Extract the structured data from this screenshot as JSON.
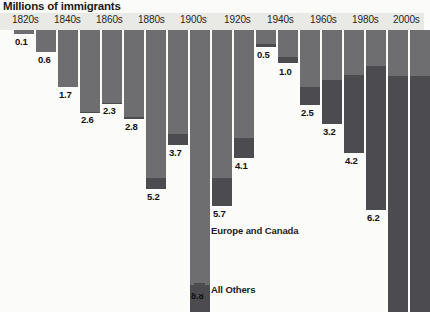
{
  "chart_data": {
    "type": "bar",
    "title": "Millions of immigrants",
    "xlabel": "",
    "ylabel": "Millions of immigrants",
    "grid": false,
    "orientation": "vertical-downward",
    "legend_position": "inside-center",
    "ylim": [
      0,
      10.5
    ],
    "categories": [
      "1820s",
      "1830s",
      "1840s",
      "1850s",
      "1860s",
      "1870s",
      "1880s",
      "1890s",
      "1900s",
      "1910s",
      "1920s",
      "1930s",
      "1940s",
      "1950s",
      "1960s",
      "1970s",
      "1980s",
      "1990s",
      "2000s"
    ],
    "tick_labels": [
      "1820s",
      "1840s",
      "1860s",
      "1880s",
      "1900s",
      "1920s",
      "1940s",
      "1960s",
      "1980s",
      "2000s"
    ],
    "values": [
      0.1,
      0.6,
      1.7,
      2.6,
      2.3,
      2.8,
      5.2,
      3.7,
      8.8,
      5.7,
      4.1,
      0.5,
      1.0,
      2.5,
      3.2,
      4.2,
      6.2,
      9.8,
      10.3
    ],
    "value_labels": [
      "0.1",
      "0.6",
      "1.7",
      "2.6",
      "2.3",
      "2.8",
      "5.2",
      "3.7",
      "8.8",
      "5.7",
      "4.1",
      "0.5",
      "1.0",
      "2.5",
      "3.2",
      "4.2",
      "6.2",
      "",
      ""
    ],
    "series": [
      {
        "name": "Europe and Canada",
        "color": "#6e6e70",
        "values": [
          0.1,
          0.6,
          1.7,
          2.6,
          2.3,
          2.8,
          4.8,
          3.3,
          8.1,
          4.8,
          3.5,
          0.4,
          0.8,
          2.0,
          1.8,
          1.6,
          1.2,
          1.6,
          1.6
        ]
      },
      {
        "name": "All Others",
        "color": "#4c4c50",
        "values": [
          0.0,
          0.0,
          0.0,
          0.0,
          0.0,
          0.0,
          0.4,
          0.4,
          0.7,
          0.9,
          0.6,
          0.1,
          0.2,
          0.5,
          1.4,
          2.6,
          5.0,
          8.2,
          8.7
        ]
      }
    ]
  },
  "legend": {
    "europe_canada": "Europe and Canada",
    "all_others": "All Others",
    "europe_color": "#6e6e70",
    "others_color": "#4c4c50"
  },
  "axis": {
    "ticks": [
      {
        "label": "1820s",
        "x": 12
      },
      {
        "label": "1840s",
        "x": 54
      },
      {
        "label": "1860s",
        "x": 96
      },
      {
        "label": "1880s",
        "x": 138
      },
      {
        "label": "1900s",
        "x": 180
      },
      {
        "label": "1920s",
        "x": 224
      },
      {
        "label": "1940s",
        "x": 267
      },
      {
        "label": "1960s",
        "x": 310
      },
      {
        "label": "1980s",
        "x": 352
      },
      {
        "label": "2000s",
        "x": 393
      }
    ]
  },
  "bars": [
    {
      "decade": "1820s",
      "label": "0.1",
      "x": 14,
      "w": 20,
      "eu_h": 4,
      "other_h": 0,
      "label_x": 15,
      "label_y": 6,
      "clipped": false
    },
    {
      "decade": "1830s",
      "label": "0.6",
      "x": 36,
      "w": 20,
      "eu_h": 22,
      "other_h": 0,
      "label_x": 38,
      "label_y": 24,
      "clipped": false
    },
    {
      "decade": "1840s",
      "label": "1.7",
      "x": 58,
      "w": 20,
      "eu_h": 57,
      "other_h": 0,
      "label_x": 59,
      "label_y": 59,
      "clipped": false
    },
    {
      "decade": "1850s",
      "label": "2.6",
      "x": 80,
      "w": 20,
      "eu_h": 82,
      "other_h": 1,
      "label_x": 81,
      "label_y": 84,
      "clipped": false
    },
    {
      "decade": "1860s",
      "label": "2.3",
      "x": 102,
      "w": 20,
      "eu_h": 73,
      "other_h": 1,
      "label_x": 103,
      "label_y": 75,
      "clipped": false
    },
    {
      "decade": "1870s",
      "label": "2.8",
      "x": 124,
      "w": 20,
      "eu_h": 87,
      "other_h": 2,
      "label_x": 125,
      "label_y": 91,
      "clipped": false
    },
    {
      "decade": "1880s",
      "label": "5.2",
      "x": 146,
      "w": 20,
      "eu_h": 148,
      "other_h": 11,
      "label_x": 147,
      "label_y": 161,
      "clipped": false
    },
    {
      "decade": "1890s",
      "label": "3.7",
      "x": 168,
      "w": 20,
      "eu_h": 104,
      "other_h": 11,
      "label_x": 169,
      "label_y": 117,
      "clipped": false
    },
    {
      "decade": "1900s",
      "label": "8.8",
      "x": 190,
      "w": 20,
      "eu_h": 255,
      "other_h": 27,
      "label_x": 191,
      "label_y": 260,
      "clipped": true
    },
    {
      "decade": "1910s",
      "label": "5.7",
      "x": 212,
      "w": 20,
      "eu_h": 148,
      "other_h": 28,
      "label_x": 213,
      "label_y": 178,
      "clipped": false
    },
    {
      "decade": "1920s",
      "label": "4.1",
      "x": 234,
      "w": 20,
      "eu_h": 108,
      "other_h": 20,
      "label_x": 235,
      "label_y": 130,
      "clipped": false
    },
    {
      "decade": "1930s",
      "label": "0.5",
      "x": 256,
      "w": 20,
      "eu_h": 14,
      "other_h": 3,
      "label_x": 257,
      "label_y": 19,
      "clipped": false
    },
    {
      "decade": "1940s",
      "label": "1.0",
      "x": 278,
      "w": 20,
      "eu_h": 27,
      "other_h": 6,
      "label_x": 279,
      "label_y": 36,
      "clipped": false
    },
    {
      "decade": "1950s",
      "label": "2.5",
      "x": 300,
      "w": 20,
      "eu_h": 57,
      "other_h": 18,
      "label_x": 301,
      "label_y": 77,
      "clipped": false
    },
    {
      "decade": "1960s",
      "label": "3.2",
      "x": 322,
      "w": 20,
      "eu_h": 50,
      "other_h": 44,
      "label_x": 323,
      "label_y": 96,
      "clipped": false
    },
    {
      "decade": "1970s",
      "label": "4.2",
      "x": 344,
      "w": 20,
      "eu_h": 45,
      "other_h": 78,
      "label_x": 345,
      "label_y": 125,
      "clipped": false
    },
    {
      "decade": "1980s",
      "label": "6.2",
      "x": 366,
      "w": 20,
      "eu_h": 36,
      "other_h": 144,
      "label_x": 367,
      "label_y": 182,
      "clipped": false
    },
    {
      "decade": "1990s",
      "label": "",
      "x": 388,
      "w": 20,
      "eu_h": 46,
      "other_h": 236,
      "label_x": 389,
      "label_y": 286,
      "clipped": true
    },
    {
      "decade": "2000s",
      "label": "",
      "x": 410,
      "w": 20,
      "eu_h": 46,
      "other_h": 236,
      "label_x": 411,
      "label_y": 286,
      "clipped": true
    }
  ]
}
